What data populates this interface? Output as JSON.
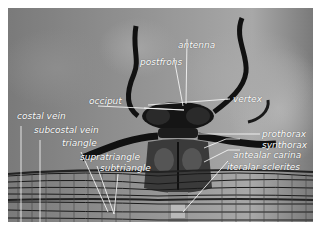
{
  "figure": {
    "label_color": "#ffffff",
    "labels": {
      "antenna": "antenna",
      "postfrons": "postfrons",
      "vertex": "vertex",
      "occiput": "occiput",
      "prothorax": "prothorax",
      "synthorax": "synthorax",
      "antealar_carina": "antealar carina",
      "alar_sclerites": "iteralar sclerites",
      "costal_vein": "costal vein",
      "subcostal_vein": "subcostal vein",
      "triangle": "triangle",
      "supratriangle": "supratriangle",
      "subtriangle": "subtriangle"
    }
  }
}
